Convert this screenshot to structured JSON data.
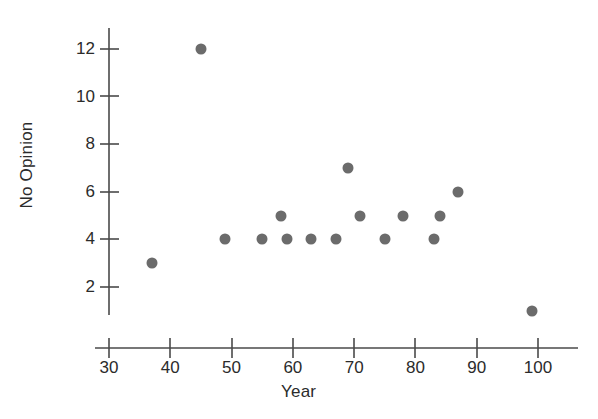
{
  "chart_data": {
    "type": "scatter",
    "title": "",
    "xlabel": "Year",
    "ylabel": "No Opinion",
    "xlim": [
      28,
      106
    ],
    "ylim": [
      0,
      13
    ],
    "xticks": [
      30,
      40,
      50,
      60,
      70,
      80,
      90,
      100
    ],
    "yticks": [
      2,
      4,
      6,
      8,
      10,
      12
    ],
    "grid": false,
    "legend": null,
    "marker_color": "#6b6b6b",
    "axis_color": "#4a4a4a",
    "text_color": "#2b2b2b",
    "x": [
      37,
      45,
      49,
      55,
      58,
      59,
      63,
      67,
      69,
      71,
      75,
      78,
      83,
      84,
      87,
      99
    ],
    "y": [
      3,
      12,
      4,
      4,
      5,
      4,
      4,
      4,
      7,
      5,
      4,
      5,
      4,
      5,
      6,
      1
    ],
    "points": [
      {
        "x": 37,
        "y": 3
      },
      {
        "x": 45,
        "y": 12
      },
      {
        "x": 49,
        "y": 4
      },
      {
        "x": 55,
        "y": 4
      },
      {
        "x": 58,
        "y": 5
      },
      {
        "x": 59,
        "y": 4
      },
      {
        "x": 63,
        "y": 4
      },
      {
        "x": 67,
        "y": 4
      },
      {
        "x": 69,
        "y": 7
      },
      {
        "x": 71,
        "y": 5
      },
      {
        "x": 75,
        "y": 4
      },
      {
        "x": 78,
        "y": 5
      },
      {
        "x": 83,
        "y": 4
      },
      {
        "x": 84,
        "y": 5
      },
      {
        "x": 87,
        "y": 6
      },
      {
        "x": 99,
        "y": 1
      }
    ]
  },
  "axes": {
    "y_title": "No Opinion",
    "x_title": "Year",
    "y_tick_labels": [
      "12",
      "10",
      "8",
      "6",
      "4",
      "2"
    ],
    "x_tick_labels": [
      "30",
      "40",
      "50",
      "60",
      "70",
      "80",
      "90",
      "100"
    ]
  }
}
